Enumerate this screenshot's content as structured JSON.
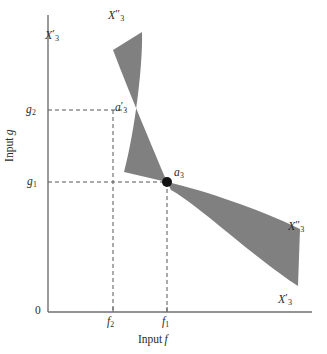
{
  "figure": {
    "type": "economics-isoquant-diagram",
    "background_color": "#ffffff",
    "ink_color": "#2b2b2b",
    "shade_color": "#808080"
  },
  "axes": {
    "x": {
      "title_text": "Input",
      "title_var": "f",
      "line": {
        "x1": 48,
        "y1": 312,
        "x2": 312,
        "y2": 312
      },
      "ticks": [
        {
          "id": "f2",
          "base": "f",
          "sub": "2",
          "x": 113
        },
        {
          "id": "f1",
          "base": "f",
          "sub": "1",
          "x": 167
        }
      ]
    },
    "y": {
      "title_text": "Input",
      "title_var": "g",
      "line": {
        "x1": 48,
        "y1": 15,
        "x2": 48,
        "y2": 312
      },
      "ticks": [
        {
          "id": "g2",
          "base": "g",
          "sub": "2",
          "y": 110
        },
        {
          "id": "g1",
          "base": "g",
          "sub": "1",
          "y": 182
        }
      ]
    },
    "origin_label": "0"
  },
  "guides": {
    "dashed_color": "#555555",
    "lines": [
      {
        "name": "g2-horizontal",
        "x1": 48,
        "y1": 110,
        "x2": 126,
        "y2": 110
      },
      {
        "name": "f2-vertical",
        "x1": 113,
        "y1": 110,
        "x2": 113,
        "y2": 312
      },
      {
        "name": "g1-horizontal",
        "x1": 48,
        "y1": 182,
        "x2": 167,
        "y2": 182
      },
      {
        "name": "f1-vertical",
        "x1": 167,
        "y1": 182,
        "x2": 167,
        "y2": 312
      }
    ]
  },
  "points": [
    {
      "id": "a3",
      "base": "a",
      "primes": "",
      "sub": "3",
      "x": 167,
      "y": 182,
      "marker": "filled-dot",
      "radius": 5
    },
    {
      "id": "a3prime",
      "base": "a",
      "primes": "′",
      "sub": "3",
      "x": 113,
      "y": 110,
      "marker": "none"
    }
  ],
  "regions": [
    {
      "id": "upper-wedge",
      "description": "shaded cone opening up-left from a3",
      "fill": "#808080",
      "path": "M 167 182 C 150 140 128 90 112 50 L 140 33 C 142 62 134 130 123 170 Z"
    },
    {
      "id": "right-wedge",
      "description": "shaded cone opening right-down from a3",
      "fill": "#808080",
      "path": "M 167 182 C 205 190 258 208 299 228 L 297 285 C 250 255 196 203 170 190 Z"
    }
  ],
  "labels": {
    "x3_prime_upper": {
      "base": "X",
      "primes": "′",
      "sub": "3"
    },
    "x3_dprime_upper": {
      "base": "X",
      "primes": "″",
      "sub": "3"
    },
    "x3_dprime_right": {
      "base": "X",
      "primes": "″",
      "sub": "3"
    },
    "x3_prime_lower": {
      "base": "X",
      "primes": "′",
      "sub": "3"
    },
    "a3_prime": {
      "base": "a",
      "primes": "′",
      "sub": "3"
    },
    "a3": {
      "base": "a",
      "primes": "",
      "sub": "3"
    }
  }
}
